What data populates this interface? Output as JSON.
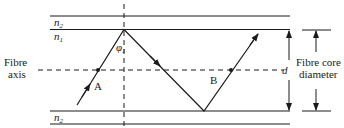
{
  "figure": {
    "labels": {
      "cladding_top": "n",
      "cladding_top_sub": "2",
      "core": "n",
      "core_sub": "1",
      "cladding_bottom": "n",
      "cladding_bottom_sub": "2",
      "angle": "φ",
      "angle_sub": "1",
      "point_a": "A",
      "point_b": "B",
      "fibre_axis_line1": "Fibre",
      "fibre_axis_line2": "axis",
      "diameter_symbol": "d",
      "core_diameter_line1": "Fibre core",
      "core_diameter_line2": "diameter"
    },
    "colors": {
      "line": "#1a1a1a",
      "background": "#ffffff"
    }
  }
}
